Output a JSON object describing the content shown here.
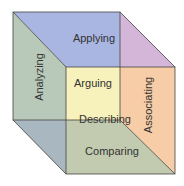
{
  "diagram": {
    "type": "cube",
    "faces": {
      "top": {
        "label": "Applying",
        "color": "#a9b6e2"
      },
      "left": {
        "label": "Analyzing",
        "color": "#b9c9b9"
      },
      "right": {
        "label": "Associating",
        "color": "#f6cda6"
      },
      "back": {
        "label": "Arguing",
        "color": "#f7f1bb"
      },
      "bottom": {
        "label": "Comparing",
        "color": "#c2cbb0"
      },
      "top_right_corner": {
        "color": "#d4b6d9"
      },
      "bottom_left_corner": {
        "color": "#a9b7c0"
      },
      "center": {
        "label": "Describing"
      }
    },
    "edge_color": "#444444"
  }
}
